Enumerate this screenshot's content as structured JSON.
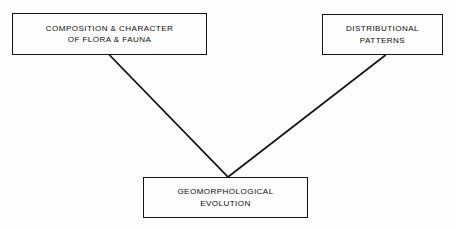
{
  "diagram": {
    "type": "flow-diagram",
    "background_color": "#fdfdfd",
    "line_color": "#15140f",
    "text_color": "#100f0c",
    "nodes": [
      {
        "id": "flora-fauna",
        "lines": [
          "COMPOSITION & CHARACTER",
          "OF FLORA & FAUNA"
        ]
      },
      {
        "id": "distributional-patterns",
        "lines": [
          "DISTRIBUTIONAL",
          "PATTERNS"
        ]
      },
      {
        "id": "geomorphological-evolution",
        "lines": [
          "GEOMORPHOLOGICAL",
          "EVOLUTION"
        ]
      }
    ],
    "connectors": [
      {
        "id": "flora-fauna-to-evolution",
        "from": "flora-fauna",
        "to": "geomorphological-evolution"
      },
      {
        "id": "patterns-to-evolution",
        "from": "distributional-patterns",
        "to": "geomorphological-evolution"
      }
    ]
  }
}
